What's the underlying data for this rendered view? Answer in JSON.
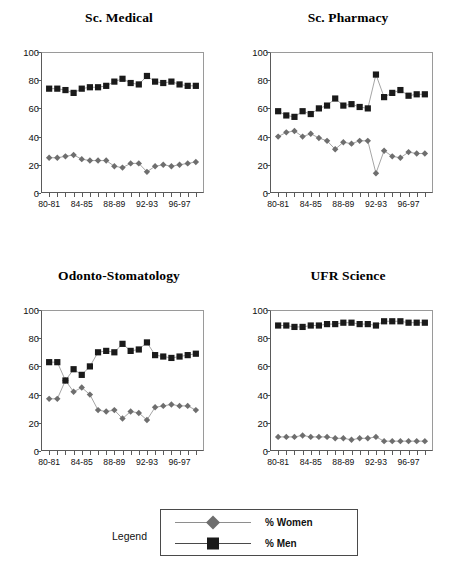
{
  "legend": {
    "label": "Legend",
    "entries": [
      {
        "name": "women-series",
        "label": "% Women",
        "marker": "diamond-marker",
        "color": "#6e6e6e"
      },
      {
        "name": "men-series",
        "label": "% Men",
        "marker": "square-marker",
        "color": "#1a1a1a"
      }
    ]
  },
  "axis": {
    "y_ticks": [
      "0",
      "20",
      "40",
      "60",
      "80",
      "100"
    ],
    "x_tick_labels": [
      "80-81",
      "84-85",
      "88-89",
      "92-93",
      "96-97"
    ],
    "x_label_indices": [
      0,
      4,
      8,
      12,
      16
    ]
  },
  "chart_data": [
    {
      "type": "line",
      "title": "Sc. Medical",
      "xlabel": "",
      "ylabel": "",
      "ylim": [
        0,
        100
      ],
      "grid": false,
      "legend_position": "bottom",
      "categories": [
        "80-81",
        "81-82",
        "82-83",
        "83-84",
        "84-85",
        "85-86",
        "86-87",
        "87-88",
        "88-89",
        "89-90",
        "90-91",
        "91-92",
        "92-93",
        "93-94",
        "94-95",
        "95-96",
        "96-97",
        "97-98",
        "98-99"
      ],
      "series": [
        {
          "name": "% Women",
          "values": [
            25,
            25,
            26,
            27,
            24,
            23,
            23,
            23,
            19,
            18,
            21,
            21,
            15,
            19,
            20,
            19,
            20,
            21,
            22
          ]
        },
        {
          "name": "% Men",
          "values": [
            74,
            74,
            73,
            71,
            74,
            75,
            75,
            76,
            79,
            81,
            78,
            77,
            83,
            79,
            78,
            79,
            77,
            76,
            76
          ]
        }
      ]
    },
    {
      "type": "line",
      "title": "Sc. Pharmacy",
      "xlabel": "",
      "ylabel": "",
      "ylim": [
        0,
        100
      ],
      "grid": false,
      "legend_position": "bottom",
      "categories": [
        "80-81",
        "81-82",
        "82-83",
        "83-84",
        "84-85",
        "85-86",
        "86-87",
        "87-88",
        "88-89",
        "89-90",
        "90-91",
        "91-92",
        "92-93",
        "93-94",
        "94-95",
        "95-96",
        "96-97",
        "97-98",
        "98-99"
      ],
      "series": [
        {
          "name": "% Women",
          "values": [
            40,
            43,
            44,
            40,
            42,
            39,
            37,
            31,
            36,
            35,
            37,
            37,
            14,
            30,
            26,
            25,
            29,
            28,
            28
          ]
        },
        {
          "name": "% Men",
          "values": [
            58,
            55,
            54,
            58,
            56,
            60,
            62,
            67,
            62,
            63,
            61,
            60,
            84,
            68,
            71,
            73,
            69,
            70,
            70
          ]
        }
      ]
    },
    {
      "type": "line",
      "title": "Odonto-Stomatology",
      "xlabel": "",
      "ylabel": "",
      "ylim": [
        0,
        100
      ],
      "grid": false,
      "legend_position": "bottom",
      "categories": [
        "80-81",
        "81-82",
        "82-83",
        "83-84",
        "84-85",
        "85-86",
        "86-87",
        "87-88",
        "88-89",
        "89-90",
        "90-91",
        "91-92",
        "92-93",
        "93-94",
        "94-95",
        "95-96",
        "96-97",
        "97-98",
        "98-99"
      ],
      "series": [
        {
          "name": "% Women",
          "values": [
            37,
            37,
            50,
            42,
            45,
            40,
            29,
            28,
            29,
            23,
            28,
            27,
            22,
            31,
            32,
            33,
            32,
            32,
            29
          ]
        },
        {
          "name": "% Men",
          "values": [
            63,
            63,
            50,
            58,
            54,
            60,
            70,
            71,
            70,
            76,
            71,
            72,
            77,
            68,
            67,
            66,
            67,
            68,
            69
          ]
        }
      ]
    },
    {
      "type": "line",
      "title": "UFR Science",
      "xlabel": "",
      "ylabel": "",
      "ylim": [
        0,
        100
      ],
      "grid": false,
      "legend_position": "bottom",
      "categories": [
        "80-81",
        "81-82",
        "82-83",
        "83-84",
        "84-85",
        "85-86",
        "86-87",
        "87-88",
        "88-89",
        "89-90",
        "90-91",
        "91-92",
        "92-93",
        "93-94",
        "94-95",
        "95-96",
        "96-97",
        "97-98",
        "98-99"
      ],
      "series": [
        {
          "name": "% Women",
          "values": [
            10,
            10,
            10,
            11,
            10,
            10,
            10,
            9,
            9,
            8,
            9,
            9,
            10,
            7,
            7,
            7,
            7,
            7,
            7
          ]
        },
        {
          "name": "% Men",
          "values": [
            89,
            89,
            88,
            88,
            89,
            89,
            90,
            90,
            91,
            91,
            90,
            90,
            89,
            92,
            92,
            92,
            91,
            91,
            91
          ]
        }
      ]
    }
  ]
}
